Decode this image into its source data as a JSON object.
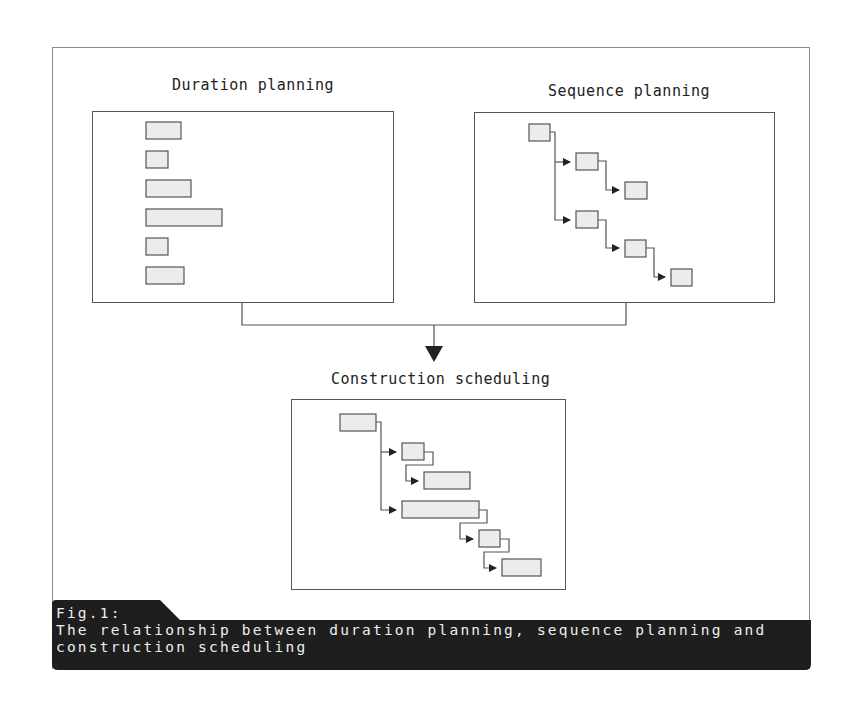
{
  "panels": {
    "duration": {
      "title": "Duration planning",
      "bars": [
        {
          "x": 146,
          "y": 122,
          "w": 35,
          "h": 17
        },
        {
          "x": 146,
          "y": 151,
          "w": 22,
          "h": 17
        },
        {
          "x": 146,
          "y": 180,
          "w": 45,
          "h": 17
        },
        {
          "x": 146,
          "y": 209,
          "w": 76,
          "h": 17
        },
        {
          "x": 146,
          "y": 238,
          "w": 22,
          "h": 17
        },
        {
          "x": 146,
          "y": 267,
          "w": 38,
          "h": 17
        }
      ]
    },
    "sequence": {
      "title": "Sequence planning",
      "nodes": [
        {
          "x": 529,
          "y": 124,
          "w": 21,
          "h": 17
        },
        {
          "x": 576,
          "y": 153,
          "w": 22,
          "h": 17
        },
        {
          "x": 625,
          "y": 182,
          "w": 22,
          "h": 17
        },
        {
          "x": 576,
          "y": 211,
          "w": 22,
          "h": 17
        },
        {
          "x": 625,
          "y": 240,
          "w": 21,
          "h": 17
        },
        {
          "x": 671,
          "y": 269,
          "w": 21,
          "h": 17
        }
      ]
    },
    "construction": {
      "title": "Construction scheduling",
      "bars": [
        {
          "x": 340,
          "y": 414,
          "w": 36,
          "h": 17
        },
        {
          "x": 402,
          "y": 443,
          "w": 22,
          "h": 17
        },
        {
          "x": 424,
          "y": 472,
          "w": 46,
          "h": 17
        },
        {
          "x": 402,
          "y": 501,
          "w": 77,
          "h": 17
        },
        {
          "x": 479,
          "y": 530,
          "w": 21,
          "h": 17
        },
        {
          "x": 502,
          "y": 559,
          "w": 39,
          "h": 17
        }
      ]
    }
  },
  "caption": {
    "label": "Fig.1:",
    "line1": "The relationship between duration planning, sequence planning and",
    "line2": "construction scheduling"
  },
  "colors": {
    "bar_fill": "#ececec",
    "line": "#555555",
    "caption_bg": "#1e1e1e",
    "caption_text": "#eeeeee"
  }
}
